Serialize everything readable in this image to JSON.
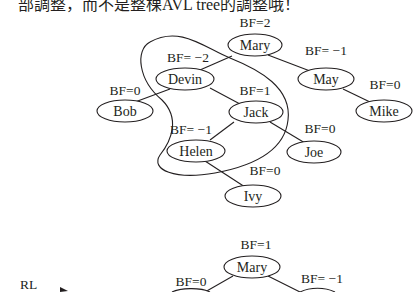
{
  "header": {
    "text": "部調整，而不是整棵AVL tree的調整哦！"
  },
  "tree_before": {
    "nodes": [
      {
        "id": "mary",
        "label": "Mary",
        "bf": "BF=2",
        "cx": 255,
        "cy": 45
      },
      {
        "id": "devin",
        "label": "Devin",
        "bf": "BF= −2",
        "cx": 185,
        "cy": 79
      },
      {
        "id": "may",
        "label": "May",
        "bf": "BF= −1",
        "cx": 326,
        "cy": 79
      },
      {
        "id": "bob",
        "label": "Bob",
        "bf": "BF=0",
        "cx": 125,
        "cy": 111
      },
      {
        "id": "jack",
        "label": "Jack",
        "bf": "BF=1",
        "cx": 256,
        "cy": 112
      },
      {
        "id": "mike",
        "label": "Mike",
        "bf": "BF=0",
        "cx": 384,
        "cy": 111
      },
      {
        "id": "helen",
        "label": "Helen",
        "bf": "BF= −1",
        "cx": 196,
        "cy": 151
      },
      {
        "id": "joe",
        "label": "Joe",
        "bf": "BF=0",
        "cx": 314,
        "cy": 152
      },
      {
        "id": "ivy",
        "label": "Ivy",
        "bf": "BF=0",
        "cx": 253,
        "cy": 196
      }
    ]
  },
  "tree_after": {
    "transition_label": "RL",
    "nodes": [
      {
        "id": "mary",
        "label": "Mary",
        "bf": "BF=1"
      },
      {
        "id": "left",
        "label": "",
        "bf": "BF=0"
      },
      {
        "id": "right",
        "label": "",
        "bf": "BF= −1"
      }
    ]
  }
}
